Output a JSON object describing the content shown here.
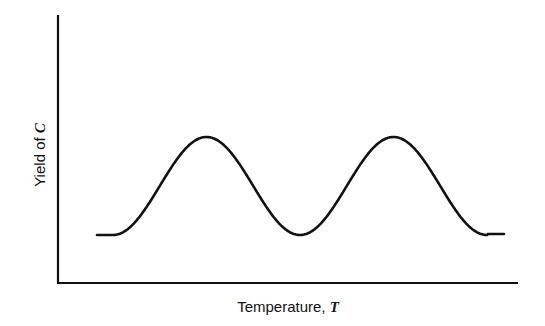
{
  "chart_data": {
    "type": "line",
    "title": "",
    "xlabel": "Temperature,",
    "xlabel_symbol": "T",
    "ylabel": "Yield of",
    "ylabel_symbol": "C",
    "x_ticks": [],
    "y_ticks": [],
    "grid": false,
    "legend": "none",
    "xlim": [
      0,
      1
    ],
    "ylim": [
      0,
      1
    ],
    "series": [
      {
        "name": "yield",
        "description": "Qualitative curve: flat baseline, two equal bell-shaped maxima separated by a minimum returning to baseline, then flat baseline",
        "x": [
          0.08,
          0.12,
          0.2,
          0.3,
          0.38,
          0.46,
          0.52,
          0.56,
          0.64,
          0.72,
          0.8,
          0.88,
          0.94,
          0.98
        ],
        "y": [
          0.2,
          0.2,
          0.33,
          0.66,
          0.71,
          0.42,
          0.2,
          0.2,
          0.55,
          0.71,
          0.6,
          0.28,
          0.2,
          0.2
        ]
      }
    ]
  }
}
